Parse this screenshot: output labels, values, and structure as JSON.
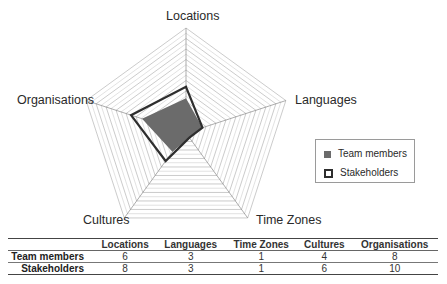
{
  "chart_data": {
    "type": "radar",
    "title": "",
    "axes": [
      "Locations",
      "Languages",
      "Time Zones",
      "Cultures",
      "Organisations"
    ],
    "range": [
      0,
      10
    ],
    "rings": 10,
    "series": [
      {
        "name": "Team members",
        "values": [
          6,
          3,
          1,
          4,
          8
        ],
        "style": "filled",
        "color": "#6b6b6b"
      },
      {
        "name": "Stakeholders",
        "values": [
          8,
          3,
          1,
          6,
          10
        ],
        "style": "outline",
        "color": "#2e2e2e"
      }
    ],
    "legend_position": "right",
    "grid": true
  },
  "axis_labels": {
    "top": "Locations",
    "right": "Languages",
    "lower_right": "Time Zones",
    "lower_left": "Cultures",
    "left": "Organisations"
  },
  "legend": {
    "items": [
      {
        "label": "Team members",
        "swatch": "filled"
      },
      {
        "label": "Stakeholders",
        "swatch": "outline"
      }
    ]
  },
  "table": {
    "columns": [
      "",
      "Locations",
      "Languages",
      "Time Zones",
      "Cultures",
      "Organisations"
    ],
    "rows": [
      {
        "label": "Team members",
        "values": [
          "6",
          "3",
          "1",
          "4",
          "8"
        ]
      },
      {
        "label": "Stakeholders",
        "values": [
          "8",
          "3",
          "1",
          "6",
          "10"
        ]
      }
    ]
  }
}
